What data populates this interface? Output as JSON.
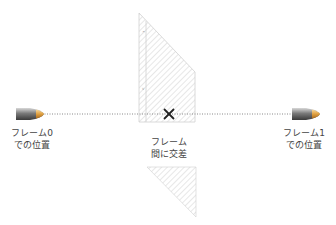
{
  "diagram": {
    "labels": {
      "frame0": {
        "line1": "フレーム0",
        "line2": "での位置"
      },
      "frame1": {
        "line1": "フレーム1",
        "line2": "での位置"
      },
      "between": {
        "line1": "フレーム",
        "line2": "間に交差"
      }
    },
    "colors": {
      "hatch": "#c8c8c8",
      "trajectory": "#888888",
      "bullet_dark": "#555555",
      "bullet_tip": "#e0a040",
      "cross": "#222222"
    }
  }
}
